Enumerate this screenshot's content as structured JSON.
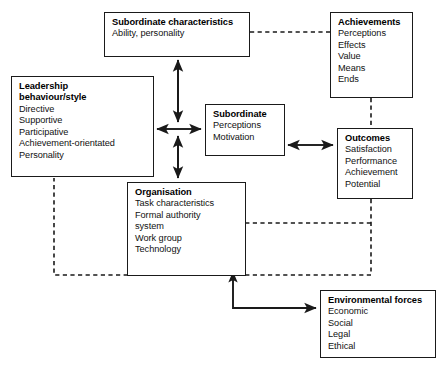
{
  "diagram": {
    "line_color": "#1a1a1a",
    "box_border_color": "#1a1a1a",
    "background_color": "#ffffff",
    "text_color": "#000000"
  },
  "nodes": {
    "subordinate_characteristics": {
      "title": "Subordinate characteristics",
      "items": [
        "Ability, personality"
      ]
    },
    "achievements": {
      "title": "Achievements",
      "items": [
        "Perceptions",
        "Effects",
        "Value",
        "Means",
        "Ends"
      ]
    },
    "leadership": {
      "title_line1": "Leadership",
      "title_line2": "behaviour/style",
      "items": [
        "Directive",
        "Supportive",
        "Participative",
        "Achievement-orientated",
        "Personality"
      ]
    },
    "subordinate": {
      "title": "Subordinate",
      "items": [
        "Perceptions",
        "Motivation"
      ]
    },
    "outcomes": {
      "title": "Outcomes",
      "items": [
        "Satisfaction",
        "Performance",
        "Achievement",
        "Potential"
      ]
    },
    "organisation": {
      "title": "Organisation",
      "items": [
        "Task characteristics",
        "Formal authority",
        "system",
        "Work group",
        "Technology"
      ]
    },
    "environmental_forces": {
      "title": "Environmental forces",
      "items": [
        "Economic",
        "Social",
        "Legal",
        "Ethical"
      ]
    }
  },
  "connectors": [
    {
      "name": "hub-to-subordinate-characteristics",
      "style": "solid",
      "arrows": "both"
    },
    {
      "name": "hub-to-organisation",
      "style": "solid",
      "arrows": "both"
    },
    {
      "name": "hub-to-leadership",
      "style": "solid",
      "arrows": "single"
    },
    {
      "name": "hub-to-subordinate",
      "style": "solid",
      "arrows": "single"
    },
    {
      "name": "subordinate-to-outcomes",
      "style": "solid",
      "arrows": "both"
    },
    {
      "name": "organisation-to-environmental-forces",
      "style": "solid",
      "arrows": "single"
    },
    {
      "name": "subordinate-characteristics-to-achievements",
      "style": "dashed",
      "arrows": "none"
    },
    {
      "name": "achievements-to-outcomes",
      "style": "dashed",
      "arrows": "none"
    },
    {
      "name": "outcomes-to-organisation-feedback",
      "style": "dashed",
      "arrows": "none"
    },
    {
      "name": "outcomes-to-leadership-feedback",
      "style": "dashed",
      "arrows": "single"
    }
  ]
}
